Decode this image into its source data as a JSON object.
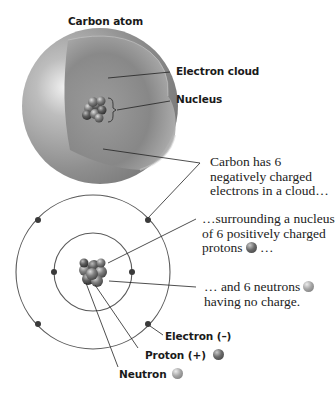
{
  "diagram": {
    "title": "Carbon atom",
    "cloud_model": {
      "labels": {
        "electron_cloud": "Electron cloud",
        "nucleus": "Nucleus"
      }
    },
    "captions": {
      "electrons": [
        "Carbon has 6",
        "negatively charged",
        "electrons in a cloud…"
      ],
      "protons": [
        "…surrounding a nucleus",
        "of 6 positively charged",
        "protons",
        "…"
      ],
      "neutrons": [
        "… and 6 neutrons",
        "having no charge."
      ]
    },
    "legend": {
      "electron": "Electron (–)",
      "proton": "Proton (+)",
      "neutron": "Neutron"
    },
    "bohr_model": {
      "inner_shell_electrons": 2,
      "outer_shell_electrons": 4
    },
    "colors": {
      "proton": "#555555",
      "neutron": "#999999",
      "orbit": "#555555",
      "electron": "#333333"
    }
  }
}
